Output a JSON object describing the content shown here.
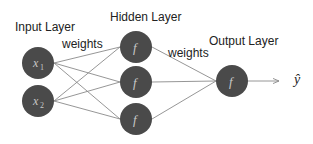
{
  "diagram": {
    "type": "neural-network",
    "layers": {
      "input": {
        "label": "Input Layer",
        "nodes": [
          "x1",
          "x2"
        ]
      },
      "hidden": {
        "label": "Hidden Layer",
        "nodes": [
          "f",
          "f",
          "f"
        ]
      },
      "output": {
        "label": "Output Layer",
        "nodes": [
          "f"
        ]
      }
    },
    "edge_labels": {
      "input_to_hidden": "weights",
      "hidden_to_output": "weights"
    },
    "output_symbol": "ŷ",
    "colors": {
      "node_fill": "#4a4a4a",
      "node_text": "#c8c8c8",
      "edge": "#8a8a8a",
      "label_text": "#222222",
      "background": "#ffffff"
    }
  }
}
